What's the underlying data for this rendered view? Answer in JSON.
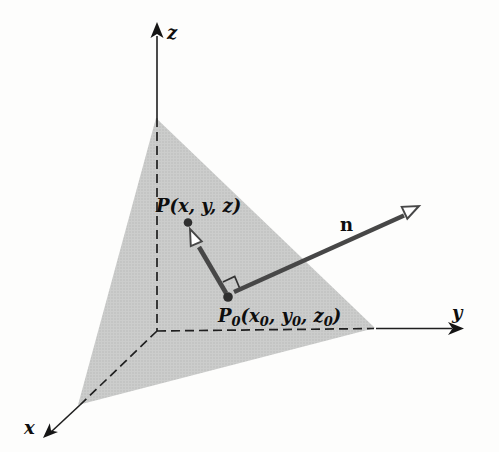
{
  "figure": {
    "axes": {
      "x_label": "x",
      "y_label": "y",
      "z_label": "z"
    },
    "labels": {
      "normal_vector": "n",
      "point_p": "P(x, y, z)",
      "point_p0_parts": {
        "p": "P",
        "p_sub": "0",
        "seg1": "(x",
        "sub1": "0",
        "seg2": ", y",
        "sub2": "0",
        "seg3": ", z",
        "sub3": "0",
        "seg4": ")"
      }
    },
    "colors": {
      "background": "#fdfdfc",
      "plane_fill": "#cccdcc",
      "plane_stipple": "#b7b8b7",
      "axis_stroke": "#1f1f1f",
      "vector_stroke": "#474747",
      "open_arrowhead_fill": "#ffffff",
      "point_fill": "#2e2e2e",
      "text": "#0e0e0e"
    }
  }
}
